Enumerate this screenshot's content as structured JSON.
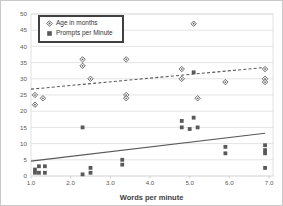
{
  "chart_data": {
    "type": "scatter",
    "title": "",
    "xlabel": "Words per minute",
    "ylabel": "",
    "xlim": [
      1.0,
      7.1
    ],
    "ylim": [
      0,
      50
    ],
    "x_ticks": [
      1.0,
      2.0,
      3.0,
      4.0,
      5.0,
      6.0,
      7.0
    ],
    "y_ticks": [
      0,
      5,
      10,
      15,
      20,
      25,
      30,
      35,
      40,
      45,
      50
    ],
    "grid": "horizontal",
    "legend_position": "top-left",
    "marker_color": "#595959",
    "gridline_color": "#d9d9d9",
    "series": [
      {
        "name": "Age in months",
        "marker": "open-diamond",
        "color": "#595959",
        "points": [
          [
            1.1,
            25
          ],
          [
            1.3,
            24
          ],
          [
            1.1,
            22
          ],
          [
            2.3,
            36
          ],
          [
            2.3,
            34
          ],
          [
            2.5,
            30
          ],
          [
            3.4,
            36
          ],
          [
            3.4,
            25
          ],
          [
            3.4,
            24
          ],
          [
            4.8,
            33
          ],
          [
            4.8,
            30
          ],
          [
            5.1,
            47
          ],
          [
            5.2,
            24
          ],
          [
            5.9,
            29
          ],
          [
            6.9,
            33
          ],
          [
            6.9,
            30
          ],
          [
            6.9,
            29
          ]
        ],
        "trendline": {
          "style": "dashed",
          "x1": 1.0,
          "y1": 26.8,
          "x2": 6.9,
          "y2": 33.5
        }
      },
      {
        "name": "Prompts per Minute",
        "marker": "filled-square",
        "color": "#595959",
        "points": [
          [
            1.1,
            1
          ],
          [
            1.1,
            2
          ],
          [
            1.2,
            3
          ],
          [
            1.2,
            1
          ],
          [
            1.35,
            3
          ],
          [
            1.35,
            1
          ],
          [
            2.3,
            15
          ],
          [
            2.3,
            0.5
          ],
          [
            2.5,
            2.5
          ],
          [
            2.5,
            1
          ],
          [
            3.3,
            5
          ],
          [
            3.3,
            3.5
          ],
          [
            4.8,
            17
          ],
          [
            4.8,
            15
          ],
          [
            5.1,
            18
          ],
          [
            5.0,
            14.5
          ],
          [
            5.2,
            15
          ],
          [
            5.1,
            32
          ],
          [
            5.9,
            9
          ],
          [
            5.9,
            7
          ],
          [
            6.9,
            9.5
          ],
          [
            6.9,
            8
          ],
          [
            6.9,
            7
          ],
          [
            6.9,
            2.5
          ]
        ],
        "trendline": {
          "style": "solid",
          "x1": 1.0,
          "y1": 4.6,
          "x2": 6.9,
          "y2": 13.2
        }
      }
    ]
  }
}
